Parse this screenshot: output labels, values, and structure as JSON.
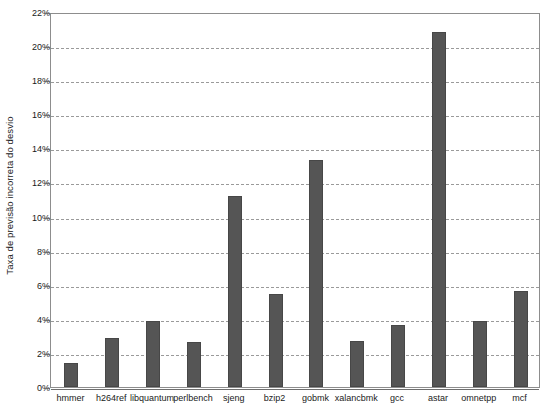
{
  "chart_data": {
    "type": "bar",
    "title": "",
    "xlabel": "",
    "ylabel": "Taxa de previsão incorreta do desvio",
    "ylim": [
      0,
      22
    ],
    "ytick_step": 2,
    "ytick_labels": [
      "0%",
      "2%",
      "4%",
      "6%",
      "8%",
      "10%",
      "12%",
      "14%",
      "16%",
      "18%",
      "20%",
      "22%"
    ],
    "ytick_values": [
      0,
      2,
      4,
      6,
      8,
      10,
      12,
      14,
      16,
      18,
      20,
      22
    ],
    "grid": true,
    "grid_axis": "y",
    "legend": false,
    "unit": "%",
    "bar_color": "#555555",
    "categories": [
      "hmmer",
      "h264ref",
      "libquantum",
      "perlbench",
      "sjeng",
      "bzip2",
      "gobmk",
      "xalancbmk",
      "gcc",
      "astar",
      "omnetpp",
      "mcf"
    ],
    "values": [
      1.4,
      2.9,
      3.9,
      2.65,
      11.2,
      5.45,
      13.3,
      2.7,
      3.65,
      20.8,
      3.9,
      5.65
    ]
  }
}
